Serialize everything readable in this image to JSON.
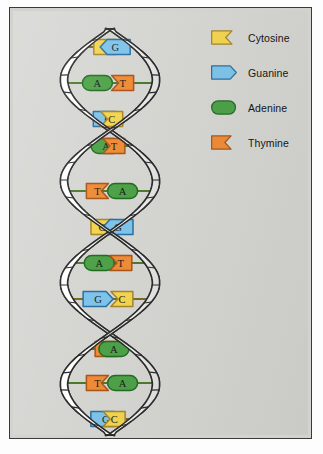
{
  "figure": {
    "background_color": "#d5d5d2",
    "frame_color": "#3a3a3a"
  },
  "colors": {
    "cytosine_fill": "#f2d44e",
    "cytosine_stroke": "#a6852a",
    "guanine_fill": "#7ec3e9",
    "guanine_stroke": "#2a6f9e",
    "adenine_fill": "#4da147",
    "adenine_stroke": "#236b23",
    "thymine_fill": "#ef8b35",
    "thymine_stroke": "#a8541a",
    "backbone_fill": "#fdfdfb",
    "backbone_stroke": "#2b2b2b",
    "letter_color": "#1a1a1a"
  },
  "legend": {
    "items": [
      {
        "label": "Cytosine",
        "code": "C",
        "shape": "notched",
        "fill": "#f2d44e",
        "stroke": "#a6852a"
      },
      {
        "label": "Guanine",
        "code": "G",
        "shape": "pointed",
        "fill": "#7ec3e9",
        "stroke": "#2a6f9e"
      },
      {
        "label": "Adenine",
        "code": "A",
        "shape": "rounded",
        "fill": "#4da147",
        "stroke": "#236b23"
      },
      {
        "label": "Thymine",
        "code": "T",
        "shape": "notched",
        "fill": "#ef8b35",
        "stroke": "#a8541a"
      }
    ]
  },
  "helix": {
    "strand_left_label": "left sugar-phosphate backbone",
    "strand_right_label": "right sugar-phosphate backbone",
    "turns": 2,
    "base_pairs": [
      {
        "index": 1,
        "y": 36,
        "left_base": "C",
        "right_base": "G",
        "width": 124,
        "cx": 93
      },
      {
        "index": 2,
        "y": 72,
        "left_base": "A",
        "right_base": "T",
        "width": 128,
        "cx": 97
      },
      {
        "index": 3,
        "y": 108,
        "left_base": "G",
        "right_base": "C",
        "width": 104,
        "cx": 101
      },
      {
        "index": 4,
        "y": 135,
        "left_base": "A",
        "right_base": "T",
        "width": 56,
        "cx": 101
      },
      {
        "index": 5,
        "y": 180,
        "left_base": "T",
        "right_base": "A",
        "width": 78,
        "cx": 98
      },
      {
        "index": 6,
        "y": 216,
        "left_base": "C",
        "right_base": "G",
        "width": 124,
        "cx": 94
      },
      {
        "index": 7,
        "y": 252,
        "left_base": "A",
        "right_base": "T",
        "width": 126,
        "cx": 93
      },
      {
        "index": 8,
        "y": 288,
        "left_base": "G",
        "right_base": "C",
        "width": 92,
        "cx": 93
      },
      {
        "index": 9,
        "y": 338,
        "left_base": "T",
        "right_base": "A",
        "width": 62,
        "cx": 100
      },
      {
        "index": 10,
        "y": 372,
        "left_base": "T",
        "right_base": "A",
        "width": 100,
        "cx": 100
      },
      {
        "index": 11,
        "y": 408,
        "left_base": "G",
        "right_base": "C",
        "width": 124,
        "cx": 99
      }
    ],
    "left_sequence": [
      "C",
      "A",
      "G",
      "A",
      "T",
      "C",
      "A",
      "G",
      "T",
      "T",
      "G"
    ],
    "right_sequence": [
      "G",
      "T",
      "C",
      "T",
      "A",
      "G",
      "T",
      "C",
      "A",
      "A",
      "C"
    ]
  }
}
